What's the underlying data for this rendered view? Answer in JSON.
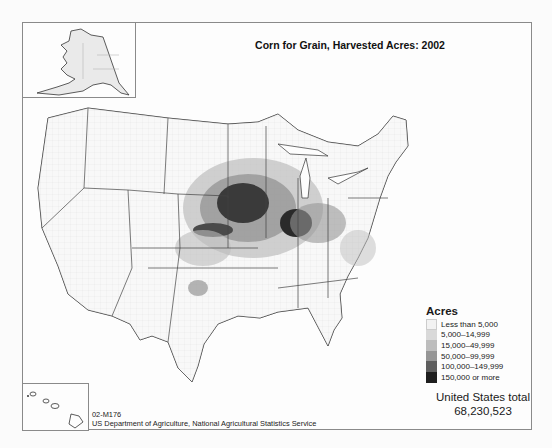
{
  "map": {
    "title": "Corn for Grain, Harvested Acres: 2002",
    "insets": [
      "Alaska",
      "Hawaii"
    ]
  },
  "legend": {
    "title": "Acres",
    "items": [
      {
        "label": "Less than 5,000",
        "color": "#f2f2f2"
      },
      {
        "label": "5,000–14,999",
        "color": "#d9d9d9"
      },
      {
        "label": "15,000–49,999",
        "color": "#bdbdbd"
      },
      {
        "label": "50,000–99,999",
        "color": "#969696"
      },
      {
        "label": "100,000–149,999",
        "color": "#5e5e5e"
      },
      {
        "label": "150,000 or more",
        "color": "#1e1e1e"
      }
    ]
  },
  "total": {
    "label": "United States total",
    "value": "68,230,523"
  },
  "footer": {
    "map_id": "02-M176",
    "source": "US Department of Agriculture, National Agricultural Statistics Service"
  }
}
